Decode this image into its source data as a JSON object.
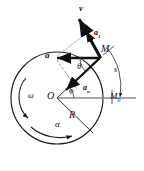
{
  "figure": {
    "type": "physics-vector-diagram",
    "colors": {
      "stroke": "#1a1a1a",
      "light_stroke": "#6f6f6f",
      "background": "#ffffff",
      "vector_fill": "#111111"
    },
    "geometry": {
      "center": {
        "x": 57,
        "y": 98
      },
      "radius": 46,
      "point_M": {
        "x": 100,
        "y": 57
      },
      "point_M0": {
        "x": 112,
        "y": 98
      }
    }
  },
  "labels": {
    "velocity": "v",
    "tangential_accel": "a",
    "tangential_accel_sub": "1",
    "resultant_accel": "a",
    "normal_accel": "a",
    "normal_accel_sub": "n",
    "point_M": "M",
    "point_M0": "M",
    "point_M0_sub": "0",
    "center_O": "O",
    "radius": "R",
    "arc_length": "s",
    "angle_theta": "θ",
    "angle_phi": "φ",
    "angular_velocity": "ω",
    "angular_accel": "α"
  },
  "icons": {
    "omega_arc_arrow": "curved-arrow-icon",
    "alpha_arc_arrow": "curved-arrow-icon",
    "arc_s_arrow": "arc-arrow-icon"
  }
}
